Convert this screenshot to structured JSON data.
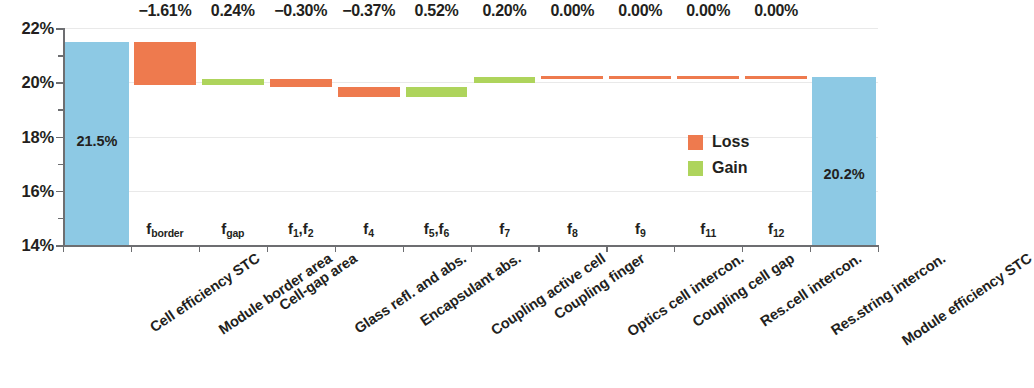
{
  "chart_data": {
    "type": "bar",
    "chart_subtype": "waterfall",
    "title": "",
    "xlabel": "",
    "ylabel": "",
    "ylim": [
      14,
      22
    ],
    "yticks": [
      14,
      16,
      18,
      20,
      22
    ],
    "ytick_labels": [
      "14%",
      "16%",
      "18%",
      "20%",
      "22%"
    ],
    "grid": true,
    "legend_position": "inside-right",
    "legend": [
      {
        "label": "Loss",
        "color": "#ee7a4e"
      },
      {
        "label": "Gain",
        "color": "#aed45c"
      }
    ],
    "colors": {
      "total": "#8dc9e4",
      "loss": "#ee7a4e",
      "gain": "#aed45c",
      "axis": "#6d6e71",
      "grid": "#e9e9e9",
      "text": "#231f20"
    },
    "categories": [
      "Cell efficiency STC",
      "Module border area",
      "Cell-gap area",
      "Glass refl. and abs.",
      "Encapsulant abs.",
      "Coupling active cell",
      "Coupling finger",
      "Optics cell intercon.",
      "Coupling cell gap",
      "Res.cell intercon.",
      "Res.string intercon.",
      "Module efficiency STC"
    ],
    "symbols": [
      {
        "base": "",
        "sub": ""
      },
      {
        "base": "f",
        "sub": "border"
      },
      {
        "base": "f",
        "sub": "gap"
      },
      {
        "base": "f",
        "sub": "1,2",
        "display": "f1,f2"
      },
      {
        "base": "f",
        "sub": "4"
      },
      {
        "base": "f",
        "sub": "5,6",
        "display": "f5,f6"
      },
      {
        "base": "f",
        "sub": "7"
      },
      {
        "base": "f",
        "sub": "8"
      },
      {
        "base": "f",
        "sub": "9"
      },
      {
        "base": "f",
        "sub": "11"
      },
      {
        "base": "f",
        "sub": "12"
      },
      {
        "base": "",
        "sub": ""
      }
    ],
    "delta_labels": [
      "",
      "−1.61%",
      "0.24%",
      "−0.30%",
      "−0.37%",
      "0.52%",
      "0.20%",
      "0.00%",
      "0.00%",
      "0.00%",
      "0.00%",
      ""
    ],
    "values": [
      21.5,
      -1.61,
      0.24,
      -0.3,
      -0.37,
      0.52,
      0.2,
      0.0,
      0.0,
      0.0,
      0.0,
      20.18
    ],
    "bar_kinds": [
      "total",
      "loss",
      "gain",
      "loss",
      "loss",
      "gain",
      "gain",
      "zero",
      "zero",
      "zero",
      "zero",
      "total"
    ],
    "cumulative_top": [
      21.5,
      21.5,
      20.13,
      20.13,
      19.83,
      19.83,
      20.18,
      20.18,
      20.18,
      20.18,
      20.18,
      20.18
    ],
    "cumulative_bottom": [
      14.0,
      19.89,
      19.89,
      19.83,
      19.46,
      19.46,
      19.98,
      20.16,
      20.16,
      20.16,
      20.16,
      14.0
    ],
    "bar_value_labels": [
      {
        "index": 0,
        "text": "21.5%"
      },
      {
        "index": 11,
        "text": "20.2%"
      }
    ]
  }
}
